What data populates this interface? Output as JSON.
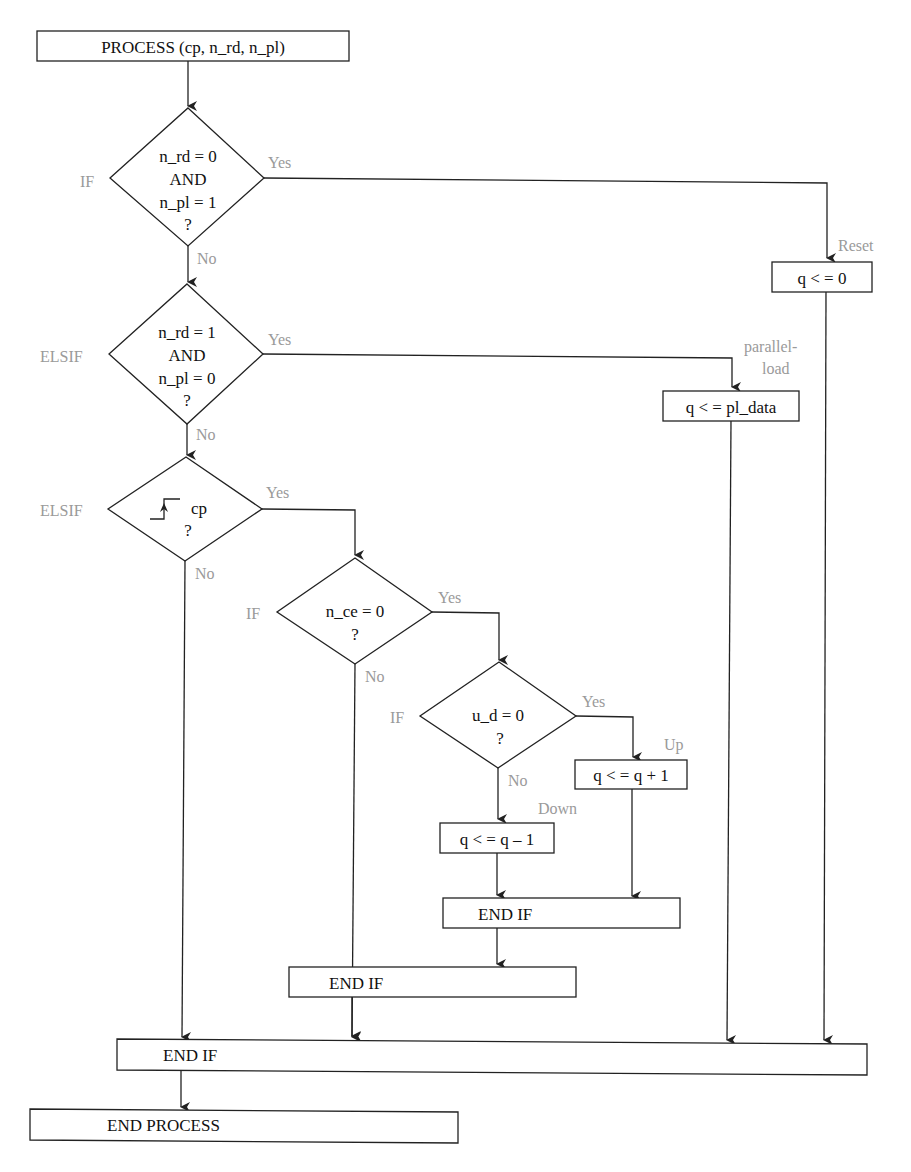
{
  "diagram": {
    "type": "flowchart",
    "nodes": {
      "process_start": "PROCESS (cp, n_rd, n_pl)",
      "cond1": {
        "line1": "n_rd = 0",
        "line2": "AND",
        "line3": "n_pl = 1",
        "line4": "?",
        "keyword": "IF"
      },
      "cond2": {
        "line1": "n_rd = 1",
        "line2": "AND",
        "line3": "n_pl = 0",
        "line4": "?",
        "keyword": "ELSIF"
      },
      "cond3": {
        "line1": "cp",
        "line2": "?",
        "keyword": "ELSIF",
        "icon": "rising-edge-icon"
      },
      "cond4": {
        "line1": "n_ce = 0",
        "line2": "?",
        "keyword": "IF"
      },
      "cond5": {
        "line1": "u_d = 0",
        "line2": "?",
        "keyword": "IF"
      },
      "reset_action": "q < = 0",
      "load_action": "q < = pl_data",
      "up_action": "q < = q + 1",
      "down_action": "q < = q – 1",
      "end_if_inner": "END IF",
      "end_if_middle": "END IF",
      "end_if_outer": "END IF",
      "end_process": "END PROCESS"
    },
    "labels": {
      "yes": "Yes",
      "no": "No",
      "reset": "Reset",
      "parallel_load_1": "parallel-",
      "parallel_load_2": "load",
      "up": "Up",
      "down": "Down"
    },
    "colors": {
      "stroke": "#222222",
      "label_gray": "#9a9a9a",
      "text": "#111111"
    }
  }
}
